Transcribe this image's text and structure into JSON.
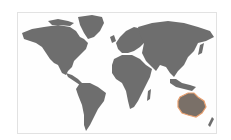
{
  "map": {
    "type": "world-map",
    "land_color": "#6e6e6e",
    "background_color": "#ffffff",
    "frame_border_color": "#e2e2e2",
    "highlight": {
      "region": "Australia",
      "outline_color": "#e8a070"
    },
    "regions": [
      "North America",
      "Greenland",
      "South America",
      "Europe",
      "Africa",
      "Asia",
      "Australia",
      "New Zealand",
      "Indonesia",
      "Japan",
      "United Kingdom"
    ]
  }
}
